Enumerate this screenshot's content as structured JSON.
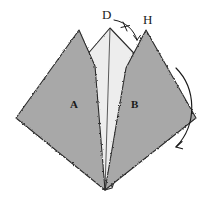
{
  "figure": {
    "background_color": "#ffffff",
    "width": 214,
    "height": 202,
    "stroke_color": "#1a1a1a",
    "labels": {
      "D": "D",
      "H": "H",
      "A": "A",
      "B": "B"
    },
    "regions": [
      {
        "id": "flap-A",
        "label": "A",
        "fill": "#a8a8a8",
        "description": "left dark-gray triangular flap"
      },
      {
        "id": "flap-B",
        "label": "B",
        "fill": "#a8a8a8",
        "description": "right dark-gray triangular flap with apex H"
      },
      {
        "id": "underlayer",
        "label": "",
        "fill": "#ededed",
        "description": "light underlying sheet with peak D"
      }
    ],
    "annotations": [
      {
        "id": "fold-arc",
        "type": "curved-arrow",
        "description": "large curved arrow on right indicating fold direction, sweeping clockwise downward",
        "color": "#1a1a1a"
      },
      {
        "id": "angle-arc",
        "type": "small-arc-with-tick",
        "description": "small arc from D to H with tick mark indicating equal angle",
        "color": "#1a1a1a"
      }
    ],
    "colors": {
      "dark_gray": "#a8a8a8",
      "light_gray": "#ededed",
      "outline": "#1a1a1a",
      "shadow": "#8e8e8e"
    }
  }
}
